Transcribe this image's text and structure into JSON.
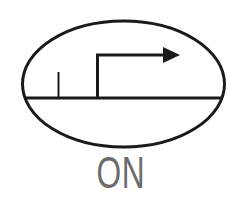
{
  "symbol": {
    "name": "timer-on-delay-symbol",
    "stroke_color": "#1a1a1a",
    "label": "ON",
    "label_color": "#6b6b6b"
  }
}
